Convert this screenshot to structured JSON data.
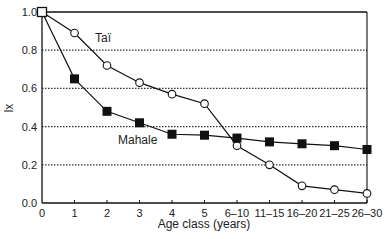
{
  "chart_data": {
    "type": "line",
    "title": "",
    "xlabel": "Age class (years)",
    "ylabel": "lx",
    "ylim": [
      0.0,
      1.0
    ],
    "yticks": [
      "0.0",
      "0.2",
      "0.4",
      "0.6",
      "0.8",
      "1.0"
    ],
    "grid": "horizontal dotted at 0.2, 0.4, 0.6, 0.8",
    "legend": "inline labels",
    "categories": [
      "0",
      "1",
      "2",
      "3",
      "4",
      "5",
      "6–10",
      "11–15",
      "16–20",
      "21–25",
      "26–30"
    ],
    "series": [
      {
        "name": "Taï",
        "marker": "open-circle",
        "values": [
          1.0,
          0.89,
          0.72,
          0.63,
          0.57,
          0.52,
          0.3,
          0.2,
          0.09,
          0.07,
          0.05
        ]
      },
      {
        "name": "Mahale",
        "marker": "filled-square",
        "values": [
          1.0,
          0.65,
          0.48,
          0.42,
          0.36,
          0.355,
          0.34,
          0.32,
          0.31,
          0.3,
          0.28
        ]
      }
    ],
    "annotations": [
      {
        "text": "Taï",
        "near_series": "Taï"
      },
      {
        "text": "Mahale",
        "near_series": "Mahale"
      }
    ]
  }
}
